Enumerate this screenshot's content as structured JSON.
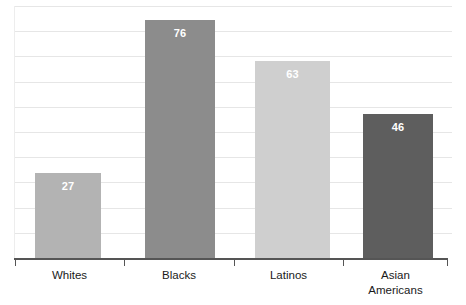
{
  "chart_data": {
    "type": "bar",
    "title": "",
    "subtitle": "",
    "xlabel": "",
    "ylabel": "",
    "categories": [
      "Whites",
      "Blacks",
      "Latinos",
      "Asian\nAmericans"
    ],
    "values": [
      27,
      76,
      63,
      46
    ],
    "value_labels": [
      "27",
      "76",
      "63",
      "46"
    ],
    "ylim": [
      0,
      84
    ],
    "grid": true,
    "gridline_count": 10,
    "legend": "none",
    "bar_colors": [
      "#b3b3b3",
      "#8c8c8c",
      "#cfcfcf",
      "#5e5e5e"
    ],
    "value_label_color": "#ffffff",
    "axis_color": "#555555",
    "gridline_color": "#e6e6e6",
    "background": "#ffffff"
  },
  "axis": {
    "tick_count": 5,
    "baseline_label": ""
  }
}
